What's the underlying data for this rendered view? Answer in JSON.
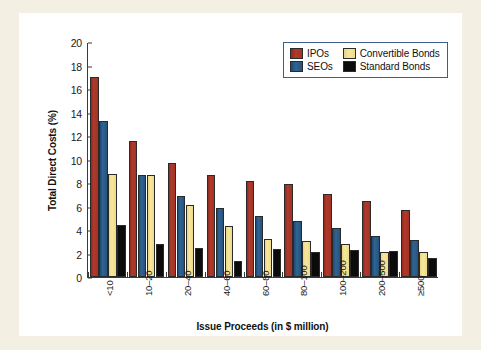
{
  "chart_data": {
    "type": "bar",
    "title": "",
    "xlabel": "Issue Proceeds (in $ million)",
    "ylabel": "Total Direct Costs (%)",
    "ylim": [
      0,
      20
    ],
    "yticks": [
      0,
      2,
      4,
      6,
      8,
      10,
      12,
      14,
      16,
      18,
      20
    ],
    "grid": false,
    "legend_position": "top-right",
    "categories": [
      "<10",
      "10–20",
      "20–40",
      "40–60",
      "60–80",
      "80–100",
      "100–200",
      "200–500",
      "≥500"
    ],
    "series": [
      {
        "name": "IPOs",
        "color": "#a33226",
        "values": [
          17.0,
          11.6,
          9.7,
          8.7,
          8.2,
          7.9,
          7.05,
          6.5,
          5.7
        ]
      },
      {
        "name": "SEOs",
        "color": "#27537c",
        "values": [
          13.3,
          8.7,
          6.9,
          5.85,
          5.2,
          4.75,
          4.2,
          3.45,
          3.15
        ]
      },
      {
        "name": "Convertible Bonds",
        "color": "#f2dd90",
        "values": [
          8.75,
          8.65,
          6.1,
          4.3,
          3.25,
          3.05,
          2.8,
          2.15,
          2.1
        ]
      },
      {
        "name": "Standard Bonds",
        "color": "#0b0b0b",
        "values": [
          4.4,
          2.8,
          2.45,
          1.35,
          2.35,
          2.15,
          2.3,
          2.2,
          1.65
        ]
      }
    ]
  },
  "legend": {
    "items": [
      {
        "label": "IPOs",
        "key": "ipos"
      },
      {
        "label": "Convertible Bonds",
        "key": "conv"
      },
      {
        "label": "SEOs",
        "key": "seos"
      },
      {
        "label": "Standard Bonds",
        "key": "std"
      }
    ]
  }
}
